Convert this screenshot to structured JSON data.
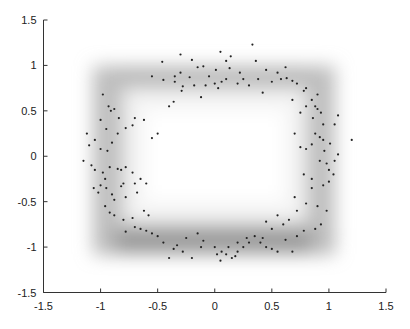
{
  "chart_data": {
    "type": "scatter",
    "title": "",
    "xlabel": "",
    "ylabel": "",
    "xlim": [
      -1.5,
      1.5
    ],
    "ylim": [
      -1.5,
      1.5
    ],
    "grid": false,
    "legend": null,
    "x_ticks": [
      "-1.5",
      "-1",
      "-0.5",
      "0",
      "0.5",
      "1",
      "1.5"
    ],
    "y_ticks": [
      "1.5",
      "1",
      "0.5",
      "0",
      "-0.5",
      "-1",
      "-1.5"
    ],
    "background": "grayscale density: square ring approx x∈[-1.05,1.05], y∈[-1.05,0.97], darker along the bottom edge",
    "point_color": "#222222",
    "series": [
      {
        "name": "samples",
        "points": [
          [
            -0.98,
            0.68
          ],
          [
            -0.93,
            0.55
          ],
          [
            -0.88,
            0.52
          ],
          [
            -0.91,
            0.5
          ],
          [
            -0.84,
            0.42
          ],
          [
            -0.78,
            0.31
          ],
          [
            -0.7,
            0.42
          ],
          [
            -0.72,
            0.34
          ],
          [
            -0.62,
            0.4
          ],
          [
            -0.55,
            0.2
          ],
          [
            -0.5,
            0.25
          ],
          [
            -0.4,
            0.55
          ],
          [
            -0.36,
            0.6
          ],
          [
            -0.29,
            0.72
          ],
          [
            -0.28,
            0.77
          ],
          [
            -0.18,
            0.78
          ],
          [
            -0.12,
            0.65
          ],
          [
            -0.05,
            0.88
          ],
          [
            0.01,
            0.95
          ],
          [
            0.03,
            0.75
          ],
          [
            0.06,
            0.82
          ],
          [
            0.1,
            0.85
          ],
          [
            0.2,
            0.8
          ],
          [
            0.22,
            0.92
          ],
          [
            0.25,
            0.85
          ],
          [
            0.33,
            1.23
          ],
          [
            0.36,
            1.05
          ],
          [
            0.38,
            0.85
          ],
          [
            0.5,
            0.82
          ],
          [
            0.58,
            0.85
          ],
          [
            0.63,
            0.86
          ],
          [
            0.68,
            0.83
          ],
          [
            0.72,
            0.8
          ],
          [
            0.78,
            0.72
          ],
          [
            0.8,
            0.75
          ],
          [
            0.85,
            0.62
          ],
          [
            0.88,
            0.55
          ],
          [
            0.9,
            0.52
          ],
          [
            0.93,
            0.48
          ],
          [
            0.95,
            0.35
          ],
          [
            -0.35,
            0.88
          ],
          [
            -0.3,
            0.92
          ],
          [
            -0.22,
            0.87
          ],
          [
            -0.2,
            1.06
          ],
          [
            -0.15,
            0.98
          ],
          [
            -0.1,
            0.99
          ],
          [
            -0.35,
            0.82
          ],
          [
            -0.45,
            0.84
          ],
          [
            -0.55,
            0.88
          ],
          [
            0.45,
            0.95
          ],
          [
            0.1,
            1.05
          ],
          [
            0.14,
            1.1
          ],
          [
            -0.46,
            1.04
          ],
          [
            -0.3,
            1.12
          ],
          [
            0.05,
            1.15
          ],
          [
            0.13,
            0.97
          ],
          [
            0.42,
            0.7
          ],
          [
            0.68,
            0.62
          ],
          [
            0.8,
            0.55
          ],
          [
            0.86,
            0.42
          ],
          [
            0.88,
            0.25
          ],
          [
            0.92,
            0.21
          ],
          [
            0.95,
            0.18
          ],
          [
            1.01,
            0.14
          ],
          [
            0.85,
            0.13
          ],
          [
            0.8,
            0.08
          ],
          [
            0.75,
            0.1
          ],
          [
            0.96,
            0.06
          ],
          [
            0.92,
            -0.05
          ],
          [
            0.98,
            -0.08
          ],
          [
            1.0,
            -0.15
          ],
          [
            1.04,
            -0.2
          ],
          [
            0.95,
            -0.32
          ],
          [
            1.0,
            -0.28
          ],
          [
            1.05,
            -0.05
          ],
          [
            1.08,
            0.02
          ],
          [
            1.2,
            0.18
          ],
          [
            1.05,
            0.35
          ],
          [
            1.08,
            0.45
          ],
          [
            0.7,
            0.25
          ],
          [
            0.85,
            -0.35
          ],
          [
            0.8,
            -0.52
          ],
          [
            0.72,
            -0.6
          ],
          [
            0.65,
            -0.7
          ],
          [
            0.6,
            -0.75
          ],
          [
            0.55,
            -0.65
          ],
          [
            0.5,
            -0.8
          ],
          [
            0.45,
            -0.72
          ],
          [
            0.9,
            -0.55
          ],
          [
            0.98,
            -0.6
          ],
          [
            0.93,
            -0.75
          ],
          [
            0.88,
            -0.8
          ],
          [
            0.78,
            -0.82
          ],
          [
            0.72,
            -0.88
          ],
          [
            0.62,
            -0.92
          ],
          [
            0.55,
            -1.05
          ],
          [
            0.5,
            -1.02
          ],
          [
            0.42,
            -0.9
          ],
          [
            0.35,
            -0.88
          ],
          [
            0.3,
            -0.95
          ],
          [
            0.25,
            -1.0
          ],
          [
            0.2,
            -1.05
          ],
          [
            0.18,
            -1.1
          ],
          [
            0.15,
            -1.12
          ],
          [
            0.1,
            -1.08
          ],
          [
            0.05,
            -1.15
          ],
          [
            0.02,
            -1.08
          ],
          [
            0.06,
            -1.05
          ],
          [
            0.12,
            -1.0
          ],
          [
            0.2,
            -0.95
          ],
          [
            0.28,
            -0.9
          ],
          [
            0.68,
            -1.05
          ],
          [
            -0.1,
            -0.93
          ],
          [
            -0.12,
            -1.0
          ],
          [
            -0.2,
            -1.12
          ],
          [
            -0.28,
            -1.05
          ],
          [
            -0.33,
            -0.98
          ],
          [
            -0.36,
            -1.02
          ],
          [
            -0.4,
            -1.12
          ],
          [
            -0.45,
            -0.95
          ],
          [
            -0.5,
            -0.88
          ],
          [
            -0.55,
            -0.85
          ],
          [
            -0.6,
            -0.82
          ],
          [
            -0.65,
            -0.8
          ],
          [
            -0.7,
            -0.78
          ],
          [
            -0.78,
            -0.83
          ],
          [
            -0.58,
            -0.65
          ],
          [
            -0.62,
            -0.6
          ],
          [
            -0.72,
            -0.68
          ],
          [
            -0.8,
            -0.7
          ],
          [
            -0.88,
            -0.65
          ],
          [
            -0.92,
            -0.62
          ],
          [
            -0.96,
            -0.55
          ],
          [
            -0.9,
            -0.42
          ],
          [
            -0.88,
            -0.48
          ],
          [
            -0.95,
            -0.35
          ],
          [
            -1.0,
            -0.32
          ],
          [
            -0.96,
            -0.25
          ],
          [
            -0.98,
            -0.18
          ],
          [
            -1.05,
            -0.15
          ],
          [
            -1.08,
            -0.1
          ],
          [
            -1.15,
            -0.05
          ],
          [
            -1.1,
            0.12
          ],
          [
            -1.05,
            0.18
          ],
          [
            -1.0,
            0.08
          ],
          [
            -0.94,
            0.06
          ],
          [
            -0.92,
            -0.12
          ],
          [
            -0.85,
            -0.14
          ],
          [
            -0.82,
            -0.15
          ],
          [
            -0.78,
            -0.12
          ],
          [
            -0.72,
            -0.18
          ],
          [
            -0.8,
            -0.3
          ],
          [
            -0.82,
            -0.33
          ],
          [
            -0.78,
            -0.45
          ],
          [
            -0.7,
            -0.3
          ],
          [
            -0.68,
            -0.4
          ],
          [
            -0.65,
            -0.25
          ],
          [
            -0.6,
            -0.3
          ],
          [
            -1.02,
            -0.4
          ],
          [
            -1.06,
            -0.35
          ],
          [
            -0.9,
            0.15
          ],
          [
            -0.85,
            0.25
          ],
          [
            -0.95,
            0.3
          ],
          [
            -1.12,
            0.25
          ],
          [
            -1.0,
            0.4
          ],
          [
            0.3,
            0.78
          ],
          [
            0.0,
            0.8
          ],
          [
            -0.08,
            0.78
          ],
          [
            0.55,
            0.92
          ],
          [
            0.62,
            0.98
          ],
          [
            0.9,
            0.68
          ],
          [
            0.75,
            0.48
          ],
          [
            0.7,
            -0.45
          ],
          [
            0.78,
            -0.2
          ],
          [
            0.85,
            -0.25
          ],
          [
            -0.25,
            -0.9
          ],
          [
            -0.15,
            -0.85
          ],
          [
            0.4,
            -0.95
          ],
          [
            0.45,
            -1.0
          ],
          [
            0.0,
            -1.0
          ]
        ]
      }
    ]
  }
}
